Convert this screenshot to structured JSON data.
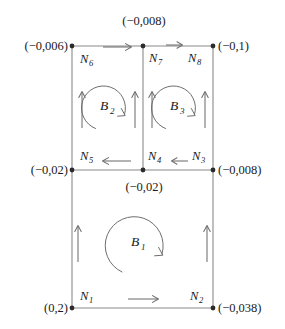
{
  "diagram": {
    "type": "mesh-block-diagram",
    "background_color": "#ffffff",
    "line_color": "#8a8a8a",
    "arrow_color": "#6e6e6e",
    "text_color": "#1a1a1a"
  },
  "coordinates": {
    "top_left": "(−0,006)",
    "top_middle": "(−0,008)",
    "top_right": "(−0,1)",
    "mid_left": "(−0,02)",
    "mid_middle": "(−0,02)",
    "mid_right": "(−0,008)",
    "bottom_left": "(0,2)",
    "bottom_right": "(−0,038)"
  },
  "nodes": [
    {
      "id": "N1",
      "base": "N",
      "sub": "1"
    },
    {
      "id": "N2",
      "base": "N",
      "sub": "2"
    },
    {
      "id": "N3",
      "base": "N",
      "sub": "3"
    },
    {
      "id": "N4",
      "base": "N",
      "sub": "4"
    },
    {
      "id": "N5",
      "base": "N",
      "sub": "5"
    },
    {
      "id": "N6",
      "base": "N",
      "sub": "6"
    },
    {
      "id": "N7",
      "base": "N",
      "sub": "7"
    },
    {
      "id": "N8",
      "base": "N",
      "sub": "8"
    }
  ],
  "blocks": [
    {
      "id": "B1",
      "base": "B",
      "sub": "1",
      "rotation": "clockwise"
    },
    {
      "id": "B2",
      "base": "B",
      "sub": "2",
      "rotation": "clockwise"
    },
    {
      "id": "B3",
      "base": "B",
      "sub": "3",
      "rotation": "clockwise"
    }
  ],
  "flow_arrows": {
    "top_left_segment": "right",
    "top_right_segment": "right",
    "mid_left_segment": "left",
    "mid_right_segment": "left",
    "bottom_segment": "right",
    "left_vertical_upper": "up",
    "middle_vertical_upper_left": "up",
    "middle_vertical_upper_right": "up",
    "right_vertical_upper": "up",
    "left_vertical_lower": "up",
    "right_vertical_lower": "up"
  }
}
